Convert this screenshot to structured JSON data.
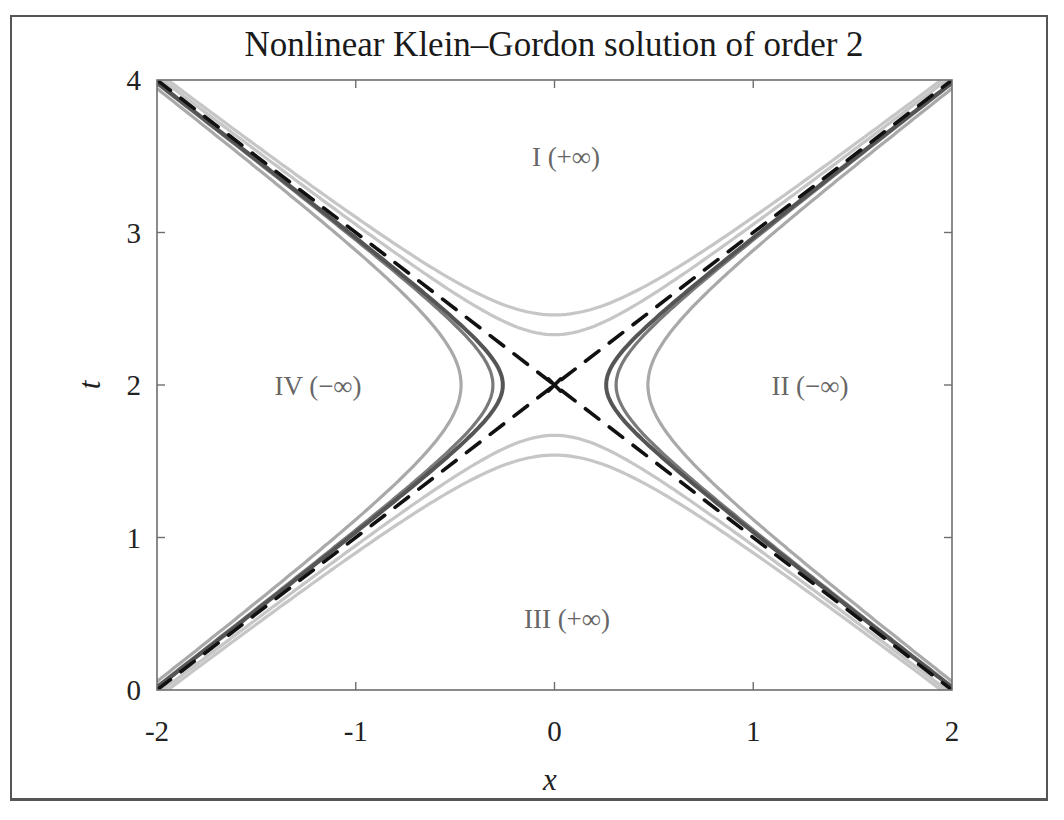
{
  "chart_data": {
    "type": "line",
    "title": "Nonlinear Klein–Gordon solution of order 2",
    "xlabel": "x",
    "ylabel": "t",
    "xlim": [
      -2,
      2
    ],
    "ylim": [
      0,
      4
    ],
    "xticks": [
      -2,
      -1,
      0,
      1,
      2
    ],
    "xtick_labels": [
      "-2",
      "-1",
      "0",
      "1",
      "2"
    ],
    "yticks": [
      0,
      1,
      2,
      3,
      4
    ],
    "ytick_labels": [
      "0",
      "1",
      "2",
      "3",
      "4"
    ],
    "grid": false,
    "legend": null,
    "region_labels": [
      {
        "text": "I (+∞)",
        "x": 0.05,
        "t": 3.5
      },
      {
        "text": "II (−∞)",
        "x": 1.38,
        "t": 2.0
      },
      {
        "text": "III (+∞)",
        "x": 0.05,
        "t": 0.45
      },
      {
        "text": "IV (−∞)",
        "x": -1.1,
        "t": 2.0
      }
    ],
    "center_marker": {
      "x": 0,
      "t": 2,
      "symbol": "x"
    },
    "series": [
      {
        "name": "asymptote t-2 = x",
        "style": "dashed",
        "color": "#111111",
        "points": [
          [
            -2,
            0
          ],
          [
            2,
            4
          ]
        ]
      },
      {
        "name": "asymptote t-2 = -x",
        "style": "dashed",
        "color": "#111111",
        "points": [
          [
            -2,
            4
          ],
          [
            2,
            0
          ]
        ]
      },
      {
        "name": "singular curve (x-branches, inner dark)",
        "style": "solid",
        "color": "#555555",
        "vertex_x": 0.26,
        "branches": "left/right"
      },
      {
        "name": "singular curve (x-branches, mid)",
        "style": "solid",
        "color": "#777777",
        "vertex_x": 0.31,
        "branches": "left/right"
      },
      {
        "name": "singular curve (x-branches, outer light)",
        "style": "solid",
        "color": "#aaaaaa",
        "vertex_x": 0.47,
        "branches": "left/right"
      },
      {
        "name": "singular curve (t-branches, inner light)",
        "style": "solid",
        "color": "#c4c4c4",
        "vertex_t_offset": 0.33,
        "branches": "upper/lower"
      },
      {
        "name": "singular curve (t-branches, outer light)",
        "style": "solid",
        "color": "#bdbdbd",
        "vertex_t_offset": 0.46,
        "branches": "upper/lower"
      }
    ]
  },
  "labels": {
    "title": "Nonlinear Klein–Gordon solution of order 2",
    "xlabel": "x",
    "ylabel": "t",
    "xticks": [
      "-2",
      "-1",
      "0",
      "1",
      "2"
    ],
    "yticks": [
      "0",
      "1",
      "2",
      "3",
      "4"
    ],
    "regions": {
      "I": "I (+∞)",
      "II": "II (−∞)",
      "III": "III (+∞)",
      "IV": "IV (−∞)"
    }
  },
  "colors": {
    "axes": "#6e6e6e",
    "frame": "#555555",
    "dashed": "#111111",
    "dark_curve": "#555555",
    "mid_curve": "#7a7a7a",
    "light_curve": "#a9a9a9",
    "pale_curve": "#c6c6c6"
  }
}
